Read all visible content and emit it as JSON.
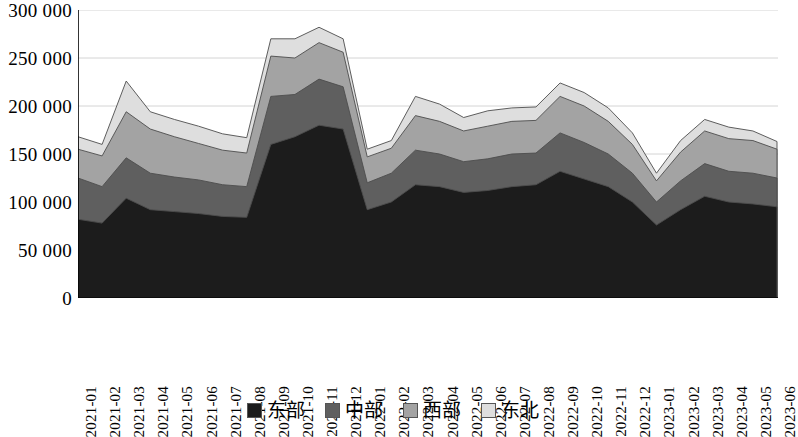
{
  "chart_data": {
    "type": "area",
    "stacked": true,
    "title": "",
    "subtitle": "",
    "xlabel": "",
    "ylabel": "",
    "ylim": [
      0,
      300000
    ],
    "ytick_step": 50000,
    "grid": true,
    "grid_axis": "y",
    "legend_position": "bottom",
    "thousands_separator": " ",
    "categories": [
      "2021-01",
      "2021-02",
      "2021-03",
      "2021-04",
      "2021-05",
      "2021-06",
      "2021-07",
      "2021-08",
      "2021-09",
      "2021-10",
      "2021-11",
      "2021-12",
      "2022-01",
      "2022-02",
      "2022-03",
      "2022-04",
      "2022-05",
      "2022-06",
      "2022-07",
      "2022-08",
      "2022-09",
      "2022-10",
      "2022-11",
      "2022-12",
      "2023-01",
      "2023-02",
      "2023-03",
      "2023-04",
      "2023-05",
      "2023-06"
    ],
    "y_tick_labels": [
      "0",
      "50 000",
      "100 000",
      "150 000",
      "200 000",
      "250 000",
      "300 000"
    ],
    "y_tick_values": [
      0,
      50000,
      100000,
      150000,
      200000,
      250000,
      300000
    ],
    "series": [
      {
        "name": "东部",
        "color": "#1c1c1c",
        "values": [
          82000,
          78000,
          104000,
          92000,
          90000,
          88000,
          85000,
          84000,
          160000,
          168000,
          180000,
          176000,
          92000,
          100000,
          118000,
          116000,
          110000,
          112000,
          116000,
          118000,
          132000,
          124000,
          116000,
          100000,
          76000,
          92000,
          106000,
          100000,
          98000,
          95000
        ]
      },
      {
        "name": "中部",
        "color": "#5f5f5f",
        "values": [
          43000,
          38000,
          42000,
          38000,
          36000,
          35000,
          33000,
          32000,
          50000,
          44000,
          48000,
          44000,
          28000,
          30000,
          36000,
          34000,
          32000,
          33000,
          34000,
          33000,
          40000,
          38000,
          34000,
          30000,
          24000,
          30000,
          34000,
          32000,
          32000,
          30000
        ]
      },
      {
        "name": "西部",
        "color": "#a3a3a3",
        "values": [
          30000,
          32000,
          48000,
          46000,
          42000,
          38000,
          36000,
          35000,
          42000,
          38000,
          38000,
          36000,
          27000,
          26000,
          36000,
          34000,
          32000,
          34000,
          34000,
          34000,
          38000,
          38000,
          34000,
          30000,
          22000,
          30000,
          34000,
          34000,
          34000,
          30000
        ]
      },
      {
        "name": "东北",
        "color": "#dedede",
        "values": [
          13000,
          12000,
          32000,
          18000,
          18000,
          18000,
          17000,
          16000,
          18000,
          20000,
          16000,
          14000,
          8000,
          8000,
          20000,
          18000,
          14000,
          16000,
          14000,
          14000,
          14000,
          14000,
          14000,
          12000,
          8000,
          12000,
          12000,
          12000,
          10000,
          8000
        ]
      }
    ]
  },
  "legend": {
    "items": [
      {
        "label": "东部",
        "color": "#1c1c1c"
      },
      {
        "label": "中部",
        "color": "#5f5f5f"
      },
      {
        "label": "西部",
        "color": "#a3a3a3"
      },
      {
        "label": "东北",
        "color": "#dedede"
      }
    ]
  }
}
